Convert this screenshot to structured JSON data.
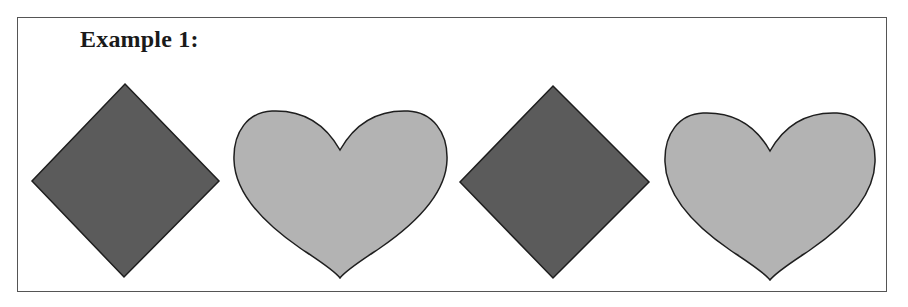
{
  "title": "Example 1:",
  "colors": {
    "diamond_fill": "#5b5b5b",
    "heart_fill": "#b3b3b3",
    "stroke": "#1e1e1e",
    "frame": "#555555"
  },
  "sequence": [
    {
      "shape": "diamond",
      "fill": "dark-gray"
    },
    {
      "shape": "heart",
      "fill": "light-gray"
    },
    {
      "shape": "diamond",
      "fill": "dark-gray"
    },
    {
      "shape": "heart",
      "fill": "light-gray"
    }
  ]
}
